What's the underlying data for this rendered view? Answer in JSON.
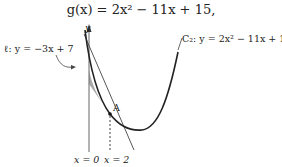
{
  "title": "g(x) = 2x² − 11x + 15,",
  "labels": {
    "y_axis": "y",
    "line": "ℓ: y = −3x + 7",
    "curve": "C₂: y = 2x² − 11x + 15",
    "point": "A",
    "x0": "x = 0",
    "x2": "x = 2"
  },
  "colors": {
    "curve": "#222222",
    "line": "#444444",
    "shade": "#9a9a9a",
    "axis": "#555555"
  }
}
